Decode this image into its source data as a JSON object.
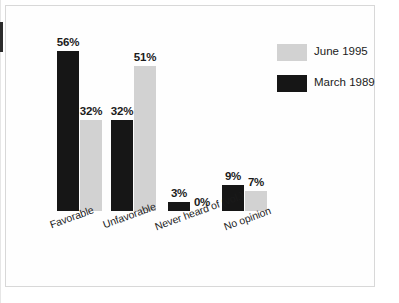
{
  "figure": {
    "background_color": "#ffffff",
    "frame_color": "#d8d8d8"
  },
  "legend": {
    "position": "top-right",
    "entries": [
      {
        "label": "June 1995",
        "color": "#d2d2d2",
        "swatch_name": "legend-swatch-june-1995"
      },
      {
        "label": "March 1989",
        "color": "#161616",
        "swatch_name": "legend-swatch-march-1989"
      }
    ]
  },
  "axis": {
    "baseline_y": 211,
    "px_per_percent": 2.85,
    "categories": [
      "Favorable",
      "Unfavorable",
      "Never heard of (vol.)",
      "No opinion"
    ]
  },
  "bars": [
    {
      "name": "favorable-march-1989",
      "series": "March 1989",
      "category": "Favorable",
      "value": 56,
      "label": "56%",
      "color": "#161616",
      "x": 57,
      "w": 22
    },
    {
      "name": "favorable-june-1995",
      "series": "June 1995",
      "category": "Favorable",
      "value": 32,
      "label": "32%",
      "color": "#d2d2d2",
      "x": 80,
      "w": 22
    },
    {
      "name": "unfavorable-march-1989",
      "series": "March 1989",
      "category": "Unfavorable",
      "value": 32,
      "label": "32%",
      "color": "#161616",
      "x": 111,
      "w": 22
    },
    {
      "name": "unfavorable-june-1995",
      "series": "June 1995",
      "category": "Unfavorable",
      "value": 51,
      "label": "51%",
      "color": "#d2d2d2",
      "x": 134,
      "w": 22
    },
    {
      "name": "never-heard-of-march-1989",
      "series": "March 1989",
      "category": "Never heard of (vol.)",
      "value": 3,
      "label": "3%",
      "color": "#161616",
      "x": 168,
      "w": 22
    },
    {
      "name": "never-heard-of-june-1995",
      "series": "June 1995",
      "category": "Never heard of (vol.)",
      "value": 0,
      "label": "0%",
      "color": "#d2d2d2",
      "x": 191,
      "w": 22
    },
    {
      "name": "no-opinion-march-1989",
      "series": "March 1989",
      "category": "No opinion",
      "value": 9,
      "label": "9%",
      "color": "#161616",
      "x": 222,
      "w": 22
    },
    {
      "name": "no-opinion-june-1995",
      "series": "June 1995",
      "category": "No opinion",
      "value": 7,
      "label": "7%",
      "color": "#d2d2d2",
      "x": 245,
      "w": 22
    }
  ],
  "category_label_positions": [
    {
      "label": "Favorable",
      "x": 48,
      "y": 219
    },
    {
      "label": "Unfavorable",
      "x": 101,
      "y": 219
    },
    {
      "label": "Never heard of (vol.)",
      "x": 153,
      "y": 221
    },
    {
      "label": "No opinion",
      "x": 222,
      "y": 221
    }
  ],
  "chart_data": {
    "type": "bar",
    "title": "",
    "subtitle": "",
    "xlabel": "",
    "ylabel": "",
    "grid": false,
    "legend_position": "top-right",
    "value_suffix": "%",
    "ylim": [
      0,
      60
    ],
    "categories": [
      "Favorable",
      "Unfavorable",
      "Never heard of (vol.)",
      "No opinion"
    ],
    "series": [
      {
        "name": "June 1995",
        "color": "#d2d2d2",
        "values": [
          32,
          51,
          0,
          7
        ]
      },
      {
        "name": "March 1989",
        "color": "#161616",
        "values": [
          56,
          32,
          3,
          9
        ]
      }
    ],
    "data_labels": [
      {
        "category": "Favorable",
        "series": "March 1989",
        "text": "56%"
      },
      {
        "category": "Favorable",
        "series": "June 1995",
        "text": "32%"
      },
      {
        "category": "Unfavorable",
        "series": "March 1989",
        "text": "32%"
      },
      {
        "category": "Unfavorable",
        "series": "June 1995",
        "text": "51%"
      },
      {
        "category": "Never heard of (vol.)",
        "series": "March 1989",
        "text": "3%"
      },
      {
        "category": "Never heard of (vol.)",
        "series": "June 1995",
        "text": "0%"
      },
      {
        "category": "No opinion",
        "series": "March 1989",
        "text": "9%"
      },
      {
        "category": "No opinion",
        "series": "June 1995",
        "text": "7%"
      }
    ]
  }
}
